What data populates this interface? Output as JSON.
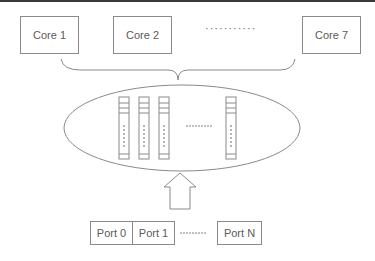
{
  "diagram": {
    "cores": [
      {
        "label": "Core 1"
      },
      {
        "label": "Core 2"
      },
      {
        "label": "Core 7"
      }
    ],
    "cores_ellipsis": "···········",
    "queue_count_shown": 4,
    "queues_ellipsis": "·········",
    "ports": [
      {
        "label": "Port 0"
      },
      {
        "label": "Port 1"
      },
      {
        "label": "Port N"
      }
    ],
    "ports_ellipsis": "·········",
    "colors": {
      "stroke": "#8a8a8a",
      "text": "#5a5a5a",
      "background": "#ffffff",
      "top_bar": "#3a3a3a"
    }
  }
}
